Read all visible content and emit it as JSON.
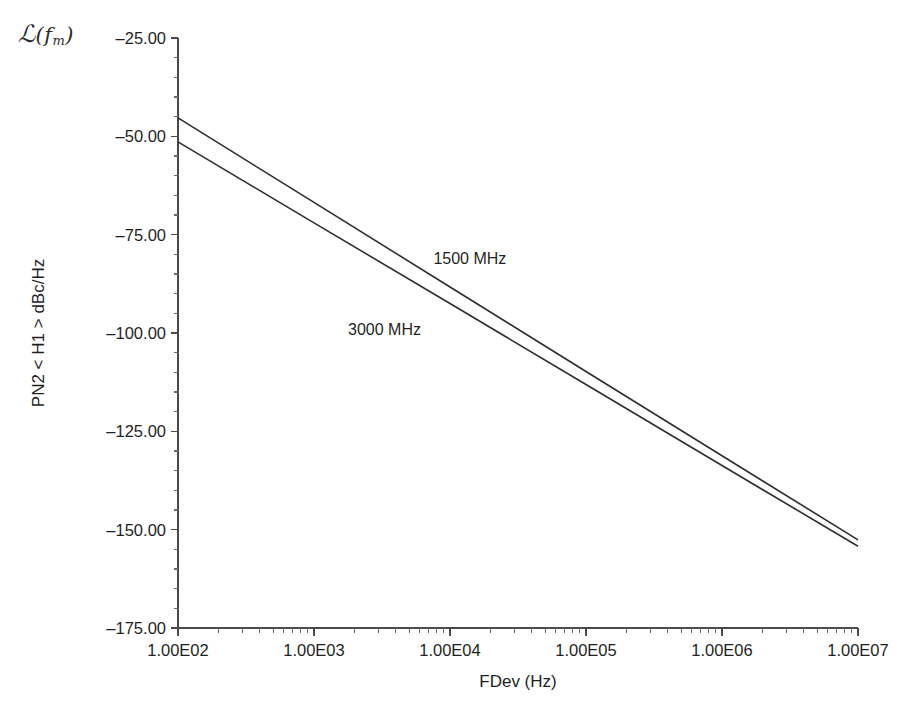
{
  "figure": {
    "corner_symbol": {
      "script_l": "ℒ",
      "open_paren": "(",
      "var": "f",
      "subscript": "m",
      "close_paren": ")"
    },
    "background_color": "#ffffff",
    "line_color": "#2e2e2e",
    "axis_color": "#4a4a4a"
  },
  "chart_data": {
    "type": "line",
    "title": "",
    "subtitle": "",
    "xlabel": "FDev (Hz)",
    "ylabel": "PN2 < H1 > dBc/Hz",
    "xscale": "log",
    "yscale": "linear",
    "xlim": [
      100,
      10000000
    ],
    "ylim": [
      -175,
      -25
    ],
    "grid": false,
    "legend_position": "inline-annotation",
    "xticks": [
      100,
      1000,
      10000,
      100000,
      1000000,
      10000000
    ],
    "xtick_labels": [
      "1.00E02",
      "1.00E03",
      "1.00E04",
      "1.00E05",
      "1.00E06",
      "1.00E07"
    ],
    "x_minor_ticks_per_decade": [
      2,
      3,
      4,
      5,
      6,
      7,
      8,
      9
    ],
    "yticks": [
      -25,
      -50,
      -75,
      -100,
      -125,
      -150,
      -175
    ],
    "ytick_labels": [
      "–25.00",
      "–50.00",
      "–75.00",
      "–100.00",
      "–125.00",
      "–150.00",
      "–175.00"
    ],
    "y_minor_tick_count_between_majors": 4,
    "annotations": [
      {
        "text": "1500 MHz",
        "x": 14000,
        "y": -82.5
      },
      {
        "text": "3000 MHz",
        "x": 3300,
        "y": -100.5
      }
    ],
    "series": [
      {
        "name": "1500 MHz",
        "color": "#2e2e2e",
        "x": [
          100,
          1000,
          10000,
          100000,
          1000000,
          10000000
        ],
        "values": [
          -45.3,
          -66.8,
          -88.3,
          -109.8,
          -131.2,
          -152.6
        ]
      },
      {
        "name": "3000 MHz",
        "color": "#2e2e2e",
        "x": [
          100,
          1000,
          10000,
          100000,
          1000000,
          10000000
        ],
        "values": [
          -51.4,
          -72.0,
          -92.5,
          -113.1,
          -133.7,
          -154.2
        ]
      }
    ]
  }
}
